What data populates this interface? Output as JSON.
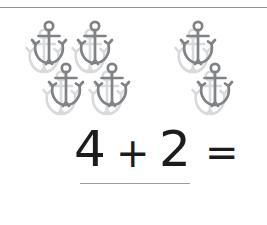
{
  "worksheet": {
    "type": "addition-problem",
    "width": 267,
    "height": 225,
    "background_color": "#ffffff"
  },
  "top_rule": {
    "name": "top-divider-rule",
    "color": "#8f9295"
  },
  "counting_objects": {
    "icon_name": "anchor-icon",
    "icon_color": "#808285",
    "icon_shadow_color": "#d8dadc",
    "total_count": 6,
    "groups": [
      {
        "group_label": "first-addend-group",
        "count": 4,
        "items": [
          {
            "label": "anchor-1",
            "x": 26,
            "y": 10
          },
          {
            "label": "anchor-2",
            "x": 72,
            "y": 10
          },
          {
            "label": "anchor-3",
            "x": 43,
            "y": 52
          },
          {
            "label": "anchor-4",
            "x": 89,
            "y": 52
          }
        ]
      },
      {
        "group_label": "second-addend-group",
        "count": 2,
        "items": [
          {
            "label": "anchor-5",
            "x": 175,
            "y": 10
          },
          {
            "label": "anchor-6",
            "x": 192,
            "y": 52
          }
        ]
      }
    ]
  },
  "equation": {
    "operand_1": "4",
    "operator_1": "+",
    "operand_2": "2",
    "operator_2": "=",
    "answer": "",
    "text_color": "#1c1c1c"
  },
  "answer_line": {
    "name": "answer-blank-line",
    "color": "#9a9c9f"
  }
}
